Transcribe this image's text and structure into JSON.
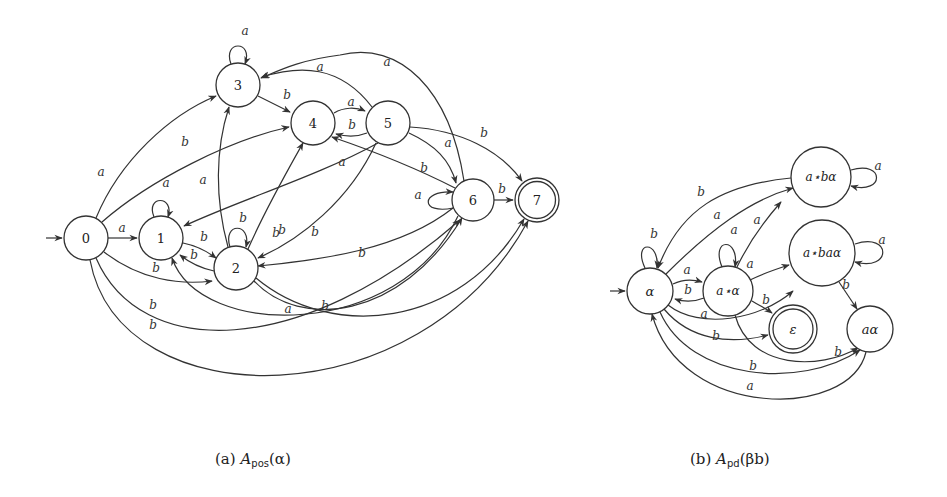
{
  "figure_a": {
    "caption": {
      "prefix": "(a)",
      "symbol": "A",
      "subscript": "pos",
      "argument": "(α)"
    },
    "nodes": [
      {
        "id": "0",
        "label": "0",
        "x": 86,
        "y": 238,
        "r": 22,
        "initial": true,
        "final": false
      },
      {
        "id": "1",
        "label": "1",
        "x": 161,
        "y": 238,
        "r": 22,
        "initial": false,
        "final": false
      },
      {
        "id": "2",
        "label": "2",
        "x": 236,
        "y": 268,
        "r": 22,
        "initial": false,
        "final": false
      },
      {
        "id": "3",
        "label": "3",
        "x": 238,
        "y": 85,
        "r": 22,
        "initial": false,
        "final": false
      },
      {
        "id": "4",
        "label": "4",
        "x": 313,
        "y": 123,
        "r": 22,
        "initial": false,
        "final": false
      },
      {
        "id": "5",
        "label": "5",
        "x": 388,
        "y": 123,
        "r": 22,
        "initial": false,
        "final": false
      },
      {
        "id": "6",
        "label": "6",
        "x": 473,
        "y": 200,
        "r": 21,
        "initial": false,
        "final": false
      },
      {
        "id": "7",
        "label": "7",
        "x": 537,
        "y": 200,
        "r": 22,
        "initial": false,
        "final": true
      }
    ],
    "edges": [
      {
        "from": "0",
        "to": "1",
        "label": "a"
      },
      {
        "from": "0",
        "to": "3",
        "label": "a"
      },
      {
        "from": "0",
        "to": "4",
        "label": "b"
      },
      {
        "from": "0",
        "to": "2",
        "label": "b"
      },
      {
        "from": "0",
        "to": "6",
        "label": "b"
      },
      {
        "from": "0",
        "to": "7",
        "label": "b"
      },
      {
        "from": "1",
        "to": "1",
        "label": "a"
      },
      {
        "from": "1",
        "to": "2",
        "label": "b"
      },
      {
        "from": "2",
        "to": "1",
        "label": "b"
      },
      {
        "from": "2",
        "to": "2",
        "label": "b"
      },
      {
        "from": "2",
        "to": "3",
        "label": "a"
      },
      {
        "from": "2",
        "to": "4",
        "label": "b"
      },
      {
        "from": "2",
        "to": "6",
        "label": "a"
      },
      {
        "from": "2",
        "to": "7",
        "label": "b"
      },
      {
        "from": "3",
        "to": "3",
        "label": "a"
      },
      {
        "from": "3",
        "to": "4",
        "label": "b"
      },
      {
        "from": "4",
        "to": "5",
        "label": "a"
      },
      {
        "from": "5",
        "to": "4",
        "label": "b"
      },
      {
        "from": "5",
        "to": "3",
        "label": "a"
      },
      {
        "from": "5",
        "to": "1",
        "label": "a"
      },
      {
        "from": "5",
        "to": "2",
        "label": "b"
      },
      {
        "from": "5",
        "to": "6",
        "label": "a"
      },
      {
        "from": "5",
        "to": "7",
        "label": "b"
      },
      {
        "from": "6",
        "to": "6",
        "label": "a"
      },
      {
        "from": "6",
        "to": "7",
        "label": "b"
      },
      {
        "from": "6",
        "to": "3",
        "label": "a"
      },
      {
        "from": "6",
        "to": "4",
        "label": "b"
      },
      {
        "from": "6",
        "to": "2",
        "label": "b"
      },
      {
        "from": "6",
        "to": "1",
        "label": "b"
      }
    ]
  },
  "figure_b": {
    "caption": {
      "prefix": "(b)",
      "symbol": "A",
      "subscript": "pd",
      "argument": "(βb)"
    },
    "nodes": [
      {
        "id": "alpha",
        "label": "α",
        "x": 650,
        "y": 291,
        "r": 23,
        "initial": true,
        "final": false
      },
      {
        "id": "astar_alpha",
        "label": "a⋆α",
        "x": 728,
        "y": 291,
        "r": 25,
        "initial": false,
        "final": false
      },
      {
        "id": "astar_b_alpha",
        "label": "a⋆bα",
        "x": 821,
        "y": 177,
        "r": 30,
        "initial": false,
        "final": false
      },
      {
        "id": "astar_ba_alpha",
        "label": "a⋆baα",
        "x": 822,
        "y": 253,
        "r": 33,
        "initial": false,
        "final": false
      },
      {
        "id": "epsilon",
        "label": "ε",
        "x": 793,
        "y": 329,
        "r": 24,
        "initial": false,
        "final": true
      },
      {
        "id": "a_alpha",
        "label": "aα",
        "x": 870,
        "y": 329,
        "r": 23,
        "initial": false,
        "final": false
      }
    ],
    "edges": [
      {
        "from": "alpha",
        "to": "alpha",
        "label": "b"
      },
      {
        "from": "alpha",
        "to": "astar_alpha",
        "label": "a"
      },
      {
        "from": "astar_alpha",
        "to": "alpha",
        "label": "b"
      },
      {
        "from": "alpha",
        "to": "astar_b_alpha",
        "label": "a"
      },
      {
        "from": "astar_b_alpha",
        "to": "alpha",
        "label": "b"
      },
      {
        "from": "alpha",
        "to": "astar_ba_alpha",
        "label": "a"
      },
      {
        "from": "alpha",
        "to": "epsilon",
        "label": "b"
      },
      {
        "from": "alpha",
        "to": "a_alpha",
        "label": "b"
      },
      {
        "from": "a_alpha",
        "to": "alpha",
        "label": "a"
      },
      {
        "from": "astar_alpha",
        "to": "astar_alpha",
        "label": "a"
      },
      {
        "from": "astar_alpha",
        "to": "astar_b_alpha",
        "label": "a"
      },
      {
        "from": "astar_alpha",
        "to": "astar_ba_alpha",
        "label": "a"
      },
      {
        "from": "astar_alpha",
        "to": "epsilon",
        "label": "b"
      },
      {
        "from": "astar_alpha",
        "to": "a_alpha",
        "label": "b"
      },
      {
        "from": "astar_b_alpha",
        "to": "astar_b_alpha",
        "label": "a"
      },
      {
        "from": "astar_ba_alpha",
        "to": "astar_ba_alpha",
        "label": "a"
      },
      {
        "from": "astar_ba_alpha",
        "to": "a_alpha",
        "label": "b"
      }
    ]
  },
  "colors": {
    "stroke": "#333333",
    "background": "#ffffff",
    "text": "#222222"
  }
}
